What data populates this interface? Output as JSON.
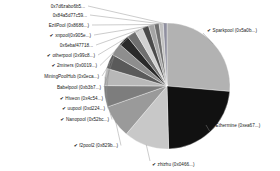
{
  "chart_data": {
    "type": "pie",
    "title": "",
    "subtitle": "",
    "xlabel": "",
    "ylabel": "",
    "legend_position": "outside-labels-with-leader-lines",
    "grid": false,
    "categories": [
      "Sparkpool (0x5a0b...)",
      "Ethermine (0xea67...)",
      "zhizhu (0x0466...)",
      "f2pool2 (0x829b...)",
      "Nanopool (0x52bc...)",
      "uupool (0xd224...)",
      "Hiveon (0x4c54...)",
      "Babelpool (0xb3b7...)",
      "MiningPoolHub (0x0eca...)",
      "2miners (0x0019...)",
      "otherpool (0x99c8...)",
      "0x6ebaf47718...",
      "xnpool (0x905e...)",
      "EzilPool (0x8686...)",
      "0x84a5d77c59...",
      "0x7d6zabo6b5..."
    ],
    "values": [
      25.0,
      22.0,
      11.0,
      8.0,
      5.2,
      4.2,
      3.6,
      3.0,
      2.6,
      2.2,
      1.9,
      1.6,
      1.4,
      1.2,
      1.0,
      0.9
    ],
    "colors": [
      "#b2b2b2",
      "#111111",
      "#c8c8c8",
      "#9a9a9a",
      "#7d7d7d",
      "#b8b8b8",
      "#5a5a5a",
      "#8e8e8e",
      "#2a2a2a",
      "#6f6f6f",
      "#d2d2d2",
      "#4a4a4a",
      "#a5a5a5",
      "#707070",
      "#c0c0c0",
      "#9090a0"
    ],
    "units": "percent",
    "total": 100
  },
  "labels": [
    {
      "text": "Sparkpool (0x5a0b...)",
      "check": "✔",
      "side": "right"
    },
    {
      "text": "Ethermine (0xea67...)",
      "check": "✔",
      "side": "right"
    },
    {
      "text": "zhizhu (0x0466...)",
      "check": "✔",
      "side": "right"
    },
    {
      "text": "f2pool2 (0x829b...)",
      "check": "✔",
      "side": "left"
    },
    {
      "text": "Nanopool (0x52bc...)",
      "check": "✔",
      "side": "left"
    },
    {
      "text": "uupool (0xd224...)",
      "check": "✔",
      "side": "left"
    },
    {
      "text": "Hiveon (0x4c54...)",
      "check": "✔",
      "side": "left"
    },
    {
      "text": "Babelpool (0xb3b7...)",
      "check": "",
      "side": "left"
    },
    {
      "text": "MiningPoolHub (0x0eca...)",
      "check": "",
      "side": "left"
    },
    {
      "text": "2miners (0x0019...)",
      "check": "✔",
      "side": "left"
    },
    {
      "text": "otherpool (0x99c8...)",
      "check": "✔",
      "side": "left"
    },
    {
      "text": "0x6ebaf47718...",
      "check": "",
      "side": "left"
    },
    {
      "text": "xnpool(0x905e...)",
      "check": "✔",
      "side": "left"
    },
    {
      "text": "EzilPool (0x8686...)",
      "check": "",
      "side": "left"
    },
    {
      "text": "0x84a5d77c59...",
      "check": "",
      "side": "left"
    },
    {
      "text": "0x7d6zabo6b5...",
      "check": "",
      "side": "left"
    }
  ],
  "style": {
    "background": "#ffffff",
    "label_color": "#1a1a1a",
    "leader_color": "#8d8d8d",
    "slice_border": "#ffffff"
  }
}
